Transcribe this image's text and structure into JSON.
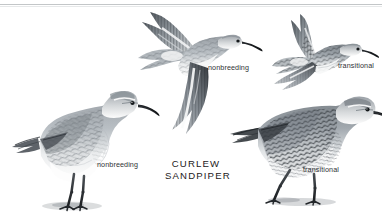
{
  "plate": {
    "title_line1": "CURLEW",
    "title_line2": "SANDPIPER",
    "species_common_name": "Curlew Sandpiper",
    "background_color": "#ffffff",
    "text_color": "#2f3234",
    "plume_gray": "#8e949a",
    "plume_dark": "#3c4146",
    "plume_light": "#e9ebec"
  },
  "figures": [
    {
      "id": "standing-left",
      "label": "nonbreeding",
      "posture": "standing",
      "plumage": "nonbreeding",
      "facing": "right"
    },
    {
      "id": "flying-center",
      "label": "nonbreeding",
      "posture": "flying",
      "plumage": "nonbreeding",
      "facing": "right"
    },
    {
      "id": "flying-right",
      "label": "transitional",
      "posture": "flying",
      "plumage": "transitional",
      "facing": "right"
    },
    {
      "id": "standing-right",
      "label": "transitional",
      "posture": "standing",
      "plumage": "transitional",
      "facing": "right"
    }
  ],
  "labels": {
    "standing_left": "nonbreeding",
    "flying_center": "nonbreeding",
    "flying_right": "transitional",
    "standing_right": "transitional"
  }
}
